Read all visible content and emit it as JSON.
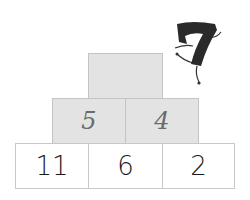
{
  "pyramid": {
    "top": {
      "value": ""
    },
    "middle": [
      {
        "value": "5"
      },
      {
        "value": "4"
      }
    ],
    "bottom": [
      {
        "value": "11"
      },
      {
        "value": "6"
      },
      {
        "value": "2"
      }
    ]
  },
  "mascot": {
    "label": "7"
  },
  "colors": {
    "shaded": "#e3e3e3",
    "border": "#c8c8c8",
    "handwriting": "#6b6b6b",
    "print": "#1a1a1a"
  }
}
